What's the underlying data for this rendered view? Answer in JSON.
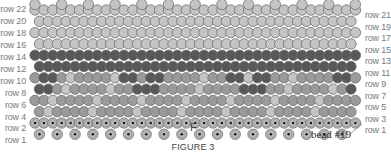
{
  "figure": {
    "caption": "FIGURE 3",
    "marker_f": "F",
    "bead_callout": "bead #19"
  },
  "row_labels_left": [
    "row 22",
    "row 20",
    "row 18",
    "row 16",
    "row 14",
    "row 12",
    "row 10",
    "row 8",
    "row 6",
    "row 4",
    "row 2",
    "row 1"
  ],
  "row_labels_right": [
    "row 21",
    "row 19",
    "row 17",
    "row 15",
    "row 13",
    "row 11",
    "row 9",
    "row 7",
    "row 5",
    "row 3",
    "row 1"
  ],
  "colors": {
    "light_bead": "#c4c4c4",
    "mid_bead": "#9a9a9a",
    "dark_bead": "#585858",
    "outline": "#6e6e6e",
    "base_bead": "#bdbdbd",
    "base_dot": "#1a1a1a"
  }
}
